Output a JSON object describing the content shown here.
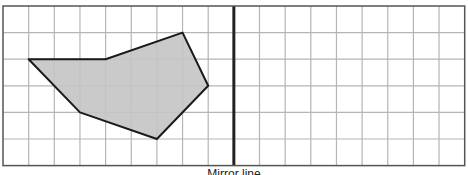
{
  "diagram": {
    "type": "grid-reflection",
    "grid": {
      "columns": 18,
      "rows": 6,
      "left": 3,
      "top": 6,
      "cell_w": 25.65,
      "cell_h": 26.6,
      "line_color": "#b5b5b5",
      "border_color": "#555555"
    },
    "mirror_line": {
      "column_index": 9,
      "color": "#222222",
      "width": 3
    },
    "shape": {
      "name": "shaded-polygon",
      "fill": "#c4c4c4",
      "stroke": "#1a1a1a",
      "vertices_grid": [
        [
          1,
          2
        ],
        [
          4,
          2
        ],
        [
          7,
          1
        ],
        [
          8,
          3
        ],
        [
          6,
          5
        ],
        [
          3,
          4
        ]
      ]
    },
    "caption": "Mirror line"
  }
}
